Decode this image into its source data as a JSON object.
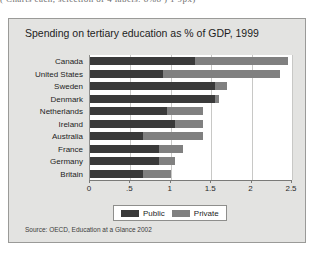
{
  "clipped_header": "( Charts  each, selection of 4 labels: 8%8 ) 1 9px)",
  "panel": {
    "title": "Spending on tertiary education as % of GDP, 1999",
    "source": "Source: OECD, Education at a Glance 2002"
  },
  "legend": {
    "items": [
      {
        "label": "Public",
        "color": "#3a3a3a"
      },
      {
        "label": "Private",
        "color": "#808080"
      }
    ]
  },
  "chart_data": {
    "type": "bar",
    "orientation": "horizontal",
    "stacked": true,
    "title": "Spending on tertiary education as % of GDP, 1999",
    "xlabel": "",
    "ylabel": "",
    "xlim": [
      0,
      2.5
    ],
    "xticks": [
      0,
      0.5,
      1,
      1.5,
      2,
      2.5
    ],
    "xticklabels": [
      "0",
      ".5",
      "1",
      "1.5",
      "2",
      "2.5"
    ],
    "grid": true,
    "legend_position": "bottom",
    "categories": [
      "Canada",
      "United States",
      "Sweden",
      "Denmark",
      "Netherlands",
      "Ireland",
      "Australia",
      "France",
      "Germany",
      "Britain"
    ],
    "series": [
      {
        "name": "Public",
        "color": "#3a3a3a",
        "values": [
          1.3,
          0.9,
          1.55,
          1.55,
          0.95,
          1.05,
          0.65,
          0.85,
          0.85,
          0.65
        ]
      },
      {
        "name": "Private",
        "color": "#808080",
        "values": [
          1.15,
          1.45,
          0.15,
          0.05,
          0.45,
          0.35,
          0.75,
          0.3,
          0.2,
          0.35
        ]
      }
    ],
    "totals": [
      2.45,
      2.35,
      1.7,
      1.6,
      1.4,
      1.4,
      1.4,
      1.15,
      1.05,
      1.0
    ]
  }
}
